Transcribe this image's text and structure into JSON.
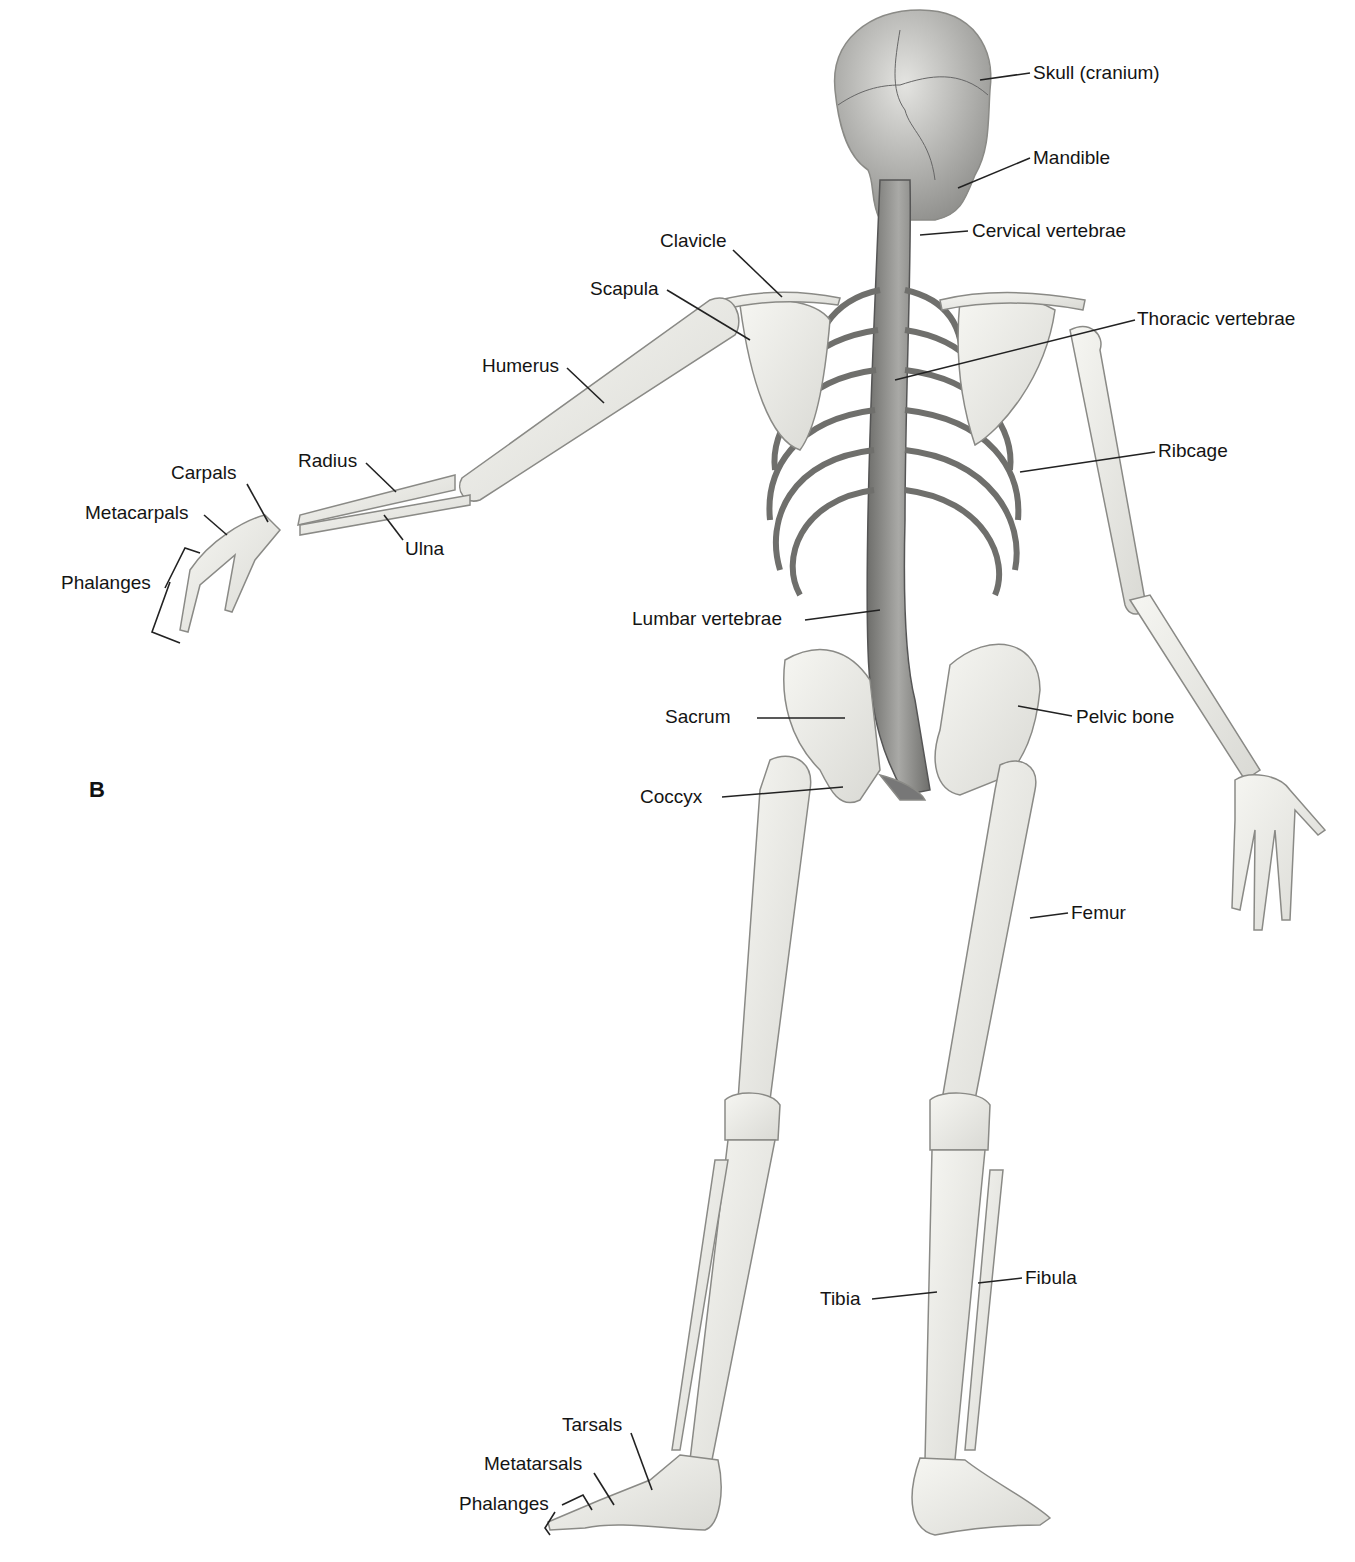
{
  "figure": {
    "panel_letter": "B",
    "view": "Posterior view of human skeleton",
    "colors": {
      "bone": "#ebebe6",
      "bone_outline": "#8a8a86",
      "axial_shade": "#7d7d7a",
      "leader": "#222222",
      "background": "#ffffff"
    }
  },
  "labels": {
    "skull": "Skull (cranium)",
    "mandible": "Mandible",
    "cervical": "Cervical vertebrae",
    "clavicle": "Clavicle",
    "scapula": "Scapula",
    "thoracic": "Thoracic vertebrae",
    "humerus": "Humerus",
    "ribcage": "Ribcage",
    "radius": "Radius",
    "carpals": "Carpals",
    "metacarpals": "Metacarpals",
    "ulna": "Ulna",
    "phalanges_hand": "Phalanges",
    "lumbar": "Lumbar vertebrae",
    "sacrum": "Sacrum",
    "pelvic": "Pelvic bone",
    "coccyx": "Coccyx",
    "femur": "Femur",
    "tibia": "Tibia",
    "fibula": "Fibula",
    "tarsals": "Tarsals",
    "metatarsals": "Metatarsals",
    "phalanges_foot": "Phalanges"
  }
}
